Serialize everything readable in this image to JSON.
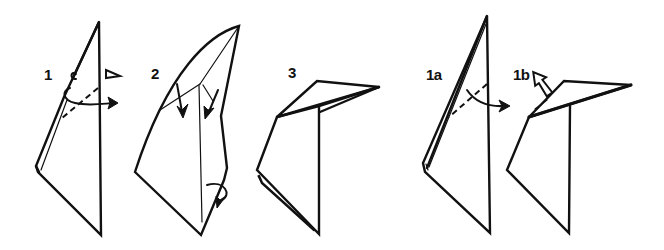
{
  "diagram": {
    "type": "origami-instructions",
    "background": "#ffffff",
    "ink_color": "#111111",
    "steps": [
      {
        "id": "step-1",
        "label": "1",
        "description": "Inside-reverse fold along dashed line (valley fold with turn-over arrow)"
      },
      {
        "id": "step-2",
        "label": "2",
        "description": "Fold flaps down along crease lines; turn over at bottom"
      },
      {
        "id": "step-3",
        "label": "3",
        "description": "Result with head folded to the right"
      },
      {
        "id": "step-1a",
        "label": "1a",
        "description": "Alternative: valley fold along dashed line"
      },
      {
        "id": "step-1b",
        "label": "1b",
        "description": "Alternative: pull out hidden layer (hollow arrow)"
      }
    ]
  }
}
